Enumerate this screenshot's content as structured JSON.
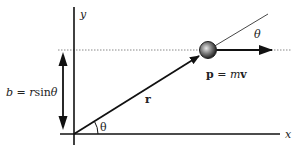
{
  "diagram": {
    "axes": {
      "x_label": "x",
      "y_label": "y"
    },
    "labels": {
      "impact_parameter": "b = rsinθ",
      "impact_parameter_parts": {
        "lhs": "b",
        "eq": " = ",
        "r": "r",
        "sin": "sin",
        "theta": "θ"
      },
      "position_vector": "r",
      "momentum": "p = mv",
      "momentum_parts": {
        "p": "p",
        "eq": " = ",
        "m": "m",
        "v": "v"
      },
      "angle_origin": "θ",
      "angle_particle": "θ"
    },
    "colors": {
      "line": "#111111",
      "dotted": "#777777",
      "particle_fill": "#555555",
      "particle_highlight": "#dddddd"
    }
  }
}
